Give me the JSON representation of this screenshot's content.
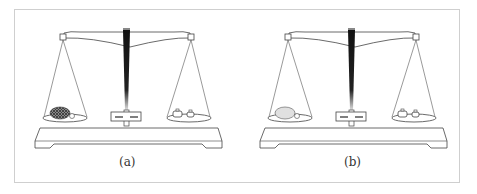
{
  "figure": {
    "panels": [
      {
        "label": "(a)",
        "left_pan_object": "textured oval object (e.g. bread/sponge) with small attached item",
        "right_pan_object": "two small weights",
        "object_color": "#555555"
      },
      {
        "label": "(b)",
        "left_pan_object": "smooth light oval object (e.g. balloon/egg) with small attached item",
        "right_pan_object": "two small weights",
        "object_color": "#dddddd"
      }
    ]
  }
}
